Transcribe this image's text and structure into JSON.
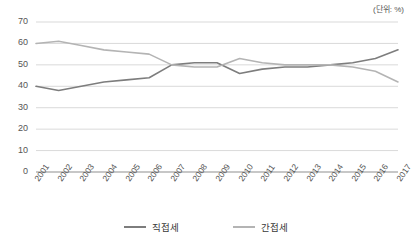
{
  "unit_note": "(단위: %)",
  "legend": {
    "position": "bottom-center",
    "items": [
      {
        "label": "직접세",
        "color": "#7d7d7d"
      },
      {
        "label": "간접세",
        "color": "#b4b4b4"
      }
    ]
  },
  "axes": {
    "y_ticks": [
      "70",
      "60",
      "50",
      "40",
      "30",
      "20",
      "10",
      "0"
    ],
    "x_ticks": [
      "2001",
      "2002",
      "2003",
      "2004",
      "2005",
      "2006",
      "2007",
      "2008",
      "2009",
      "2010",
      "2011",
      "2012",
      "2013",
      "2014",
      "2015",
      "2016",
      "2017"
    ]
  },
  "chart_data": {
    "type": "line",
    "title": "",
    "subtitle": "",
    "xlabel": "",
    "ylabel": "",
    "unit": "(단위: %)",
    "ylim": [
      0,
      70
    ],
    "ytick_step": 10,
    "grid": "horizontal",
    "legend_position": "bottom-center",
    "categories": [
      "2001",
      "2002",
      "2003",
      "2004",
      "2005",
      "2006",
      "2007",
      "2008",
      "2009",
      "2010",
      "2011",
      "2012",
      "2013",
      "2014",
      "2015",
      "2016",
      "2017"
    ],
    "series": [
      {
        "name": "직접세",
        "color": "#7d7d7d",
        "values": [
          40,
          38,
          40,
          42,
          43,
          44,
          50,
          51,
          51,
          46,
          48,
          49,
          49,
          50,
          51,
          53,
          57
        ]
      },
      {
        "name": "간접세",
        "color": "#b4b4b4",
        "values": [
          60,
          61,
          59,
          57,
          56,
          55,
          50,
          49,
          49,
          53,
          51,
          50,
          50,
          50,
          49,
          47,
          42
        ]
      }
    ]
  }
}
